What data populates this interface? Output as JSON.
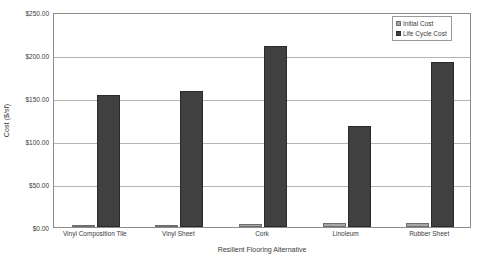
{
  "chart_data": {
    "type": "bar",
    "title": "",
    "xlabel": "Resilient Flooring Alternative",
    "ylabel": "Cost ($/sf)",
    "categories": [
      "Vinyl Composition Tile",
      "Vinyl Sheet",
      "Cork",
      "Linoleum",
      "Rubber Sheet"
    ],
    "series": [
      {
        "name": "Initial Cost",
        "color": "#a6a6a6",
        "values": [
          1.2,
          2.0,
          3.2,
          4.2,
          5.2
        ]
      },
      {
        "name": "Life Cycle Cost",
        "color": "#404040",
        "values": [
          153.0,
          158.0,
          211.0,
          117.0,
          192.0
        ]
      }
    ],
    "ylim": [
      0,
      250
    ],
    "ytick_values": [
      0,
      50,
      100,
      150,
      200,
      250
    ],
    "ytick_labels": [
      "$0.00",
      "$50.00",
      "$100.00",
      "$150.00",
      "$200.00",
      "$250.00"
    ],
    "grid": true,
    "legend_position": "top-right"
  },
  "legend": {
    "entries": [
      {
        "label": "Initial Cost",
        "swatch": "initial"
      },
      {
        "label": "Life Cycle Cost",
        "swatch": "lifecycle"
      }
    ]
  },
  "colors": {
    "initial_cost": "#a6a6a6",
    "life_cycle_cost": "#404040",
    "gridline": "#b5b5b5",
    "axis": "#8d8d8d",
    "text": "#3a3a3a",
    "background": "#ffffff"
  }
}
